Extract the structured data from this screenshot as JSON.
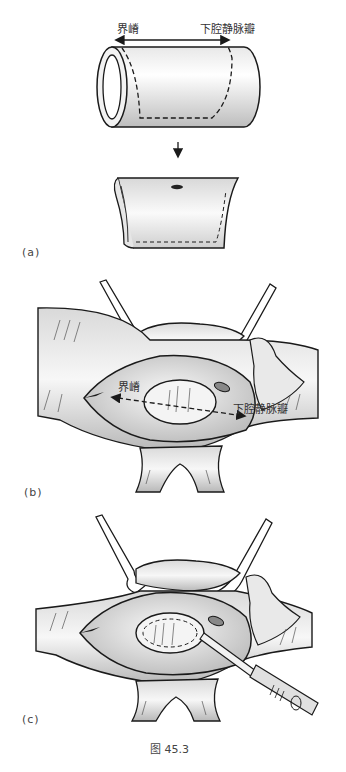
{
  "figure": {
    "caption": "图 45.3",
    "colors": {
      "line": "#1a1a1a",
      "shade": "#cfcfcf",
      "light": "#f4f4f4",
      "dark": "#555555"
    }
  },
  "panels": [
    {
      "id": "a",
      "label": "(a)",
      "annotations": {
        "left": "界嵴",
        "right": "下腔静脉瓣"
      },
      "description": "Cylindrical tube with dashed cut outline; arrow down to opened patch with hole"
    },
    {
      "id": "b",
      "label": "(b)",
      "annotations": {
        "left": "界嵴",
        "right": "下腔静脉瓣"
      },
      "description": "Opened right atrium held by two retractors; dashed double arrow across oval fossa"
    },
    {
      "id": "c",
      "label": "(c)",
      "annotations": {},
      "description": "Same surgical view with scalpel incising dashed oval outline"
    }
  ]
}
